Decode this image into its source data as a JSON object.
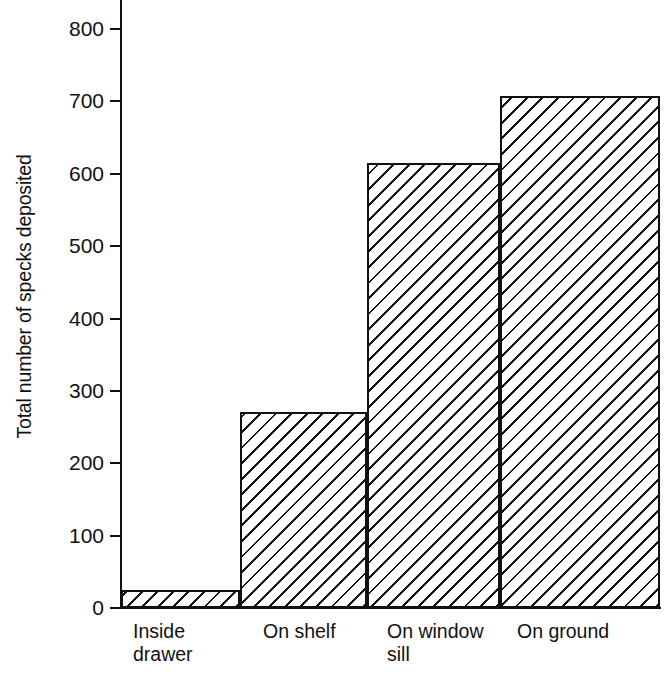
{
  "chart_data": {
    "type": "bar",
    "title": "",
    "subtitle": "",
    "xlabel": "",
    "ylabel": "Total number of specks deposited",
    "categories": [
      "Inside drawer",
      "On shelf",
      "On window sill",
      "On ground"
    ],
    "values": [
      25,
      271,
      615,
      707
    ],
    "ylim": [
      0,
      800
    ],
    "yticks": [
      0,
      100,
      200,
      300,
      400,
      500,
      600,
      700,
      800
    ],
    "ytick_labels": [
      "0",
      "100",
      "200",
      "300",
      "400",
      "500",
      "600",
      "700",
      "800"
    ],
    "grid": false,
    "legend": null,
    "bar_fill": "diagonal-hatch",
    "bar_fill_color": "#111111",
    "bar_background_color": "#ffffff",
    "axis_color": "#111111",
    "series": [
      {
        "name": "Total number of specks deposited",
        "values": [
          25,
          271,
          615,
          707
        ]
      }
    ]
  },
  "axis": {
    "y_title": "Total number of specks deposited",
    "ticks": [
      {
        "label": "800",
        "value": 800
      },
      {
        "label": "700",
        "value": 700
      },
      {
        "label": "600",
        "value": 600
      },
      {
        "label": "500",
        "value": 500
      },
      {
        "label": "400",
        "value": 400
      },
      {
        "label": "300",
        "value": 300
      },
      {
        "label": "200",
        "value": 200
      },
      {
        "label": "100",
        "value": 100
      },
      {
        "label": "0",
        "value": 0
      }
    ]
  },
  "categories": [
    {
      "label": "Inside\ndrawer",
      "line1": "Inside",
      "line2": "drawer",
      "value": 25
    },
    {
      "label": "On shelf",
      "line1": "On shelf",
      "line2": "",
      "value": 271
    },
    {
      "label": "On window\nsill",
      "line1": "On window",
      "line2": "sill",
      "value": 615
    },
    {
      "label": "On ground",
      "line1": "On ground",
      "line2": "",
      "value": 707
    }
  ]
}
